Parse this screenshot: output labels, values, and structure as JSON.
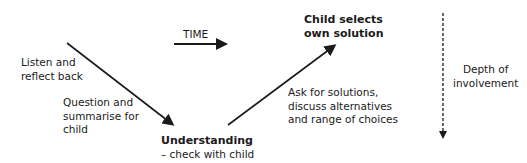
{
  "labels": {
    "time": "TIME",
    "listen_line1": "Listen and",
    "listen_line2": "reflect back",
    "question_line1": "Question and",
    "question_line2": "summarise for",
    "question_line3": "child",
    "understanding_title": "Understanding",
    "understanding_sub": "– check with child",
    "ask_line1": "Ask for solutions,",
    "ask_line2": "discuss alternatives",
    "ask_line3": "and range of choices",
    "child_selects_line1": "Child selects",
    "child_selects_line2": "own solution",
    "depth_line1": "Depth of",
    "depth_line2": "involvement"
  },
  "colors": {
    "stroke": "#1a1a1a",
    "background": "#ffffff"
  }
}
